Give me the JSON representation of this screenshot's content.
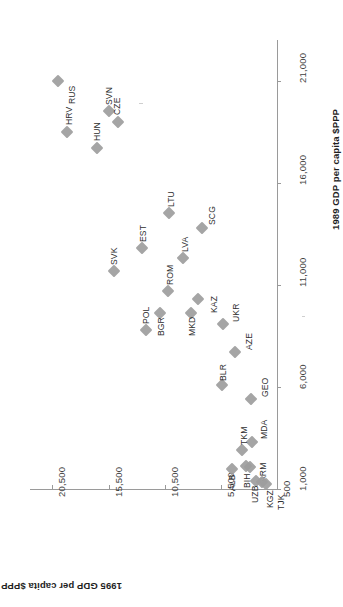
{
  "chart_data": {
    "type": "scatter",
    "title": "",
    "xlabel": "1989 GDP per capita $PPP",
    "ylabel": "1995 GDP per capita $PPP",
    "xlim": [
      1000,
      23000
    ],
    "ylim": [
      500,
      22500
    ],
    "xticks": [
      "1,000",
      "6,000",
      "11,000",
      "16,000",
      "21,000"
    ],
    "xtick_values": [
      1000,
      6000,
      11000,
      16000,
      21000
    ],
    "yticks": [
      "500",
      "5,500",
      "10,500",
      "15,500",
      "20,500"
    ],
    "ytick_values": [
      500,
      5500,
      10500,
      15500,
      20500
    ],
    "grid": false,
    "legend": false,
    "rotation_deg": -90,
    "marker_color": "#9d9d9d",
    "axis_color": "#9a9a9a",
    "points": [
      {
        "label": "RUS",
        "x": 21000,
        "y": 20000,
        "label_dx": 9,
        "label_dy": 13
      },
      {
        "label": "SVN",
        "x": 19500,
        "y": 15500,
        "label_dx": -5,
        "label_dy": -16
      },
      {
        "label": "CZE",
        "x": 19000,
        "y": 14700,
        "label_dx": -6,
        "label_dy": -17
      },
      {
        "label": "HRV",
        "x": 18500,
        "y": 19200,
        "label_dx": -3,
        "label_dy": -17
      },
      {
        "label": "HUN",
        "x": 17700,
        "y": 16500,
        "label_dx": -5,
        "label_dy": -17
      },
      {
        "label": "LTU",
        "x": 14500,
        "y": 10100,
        "label_dx": -3,
        "label_dy": -16
      },
      {
        "label": "SCG",
        "x": 13800,
        "y": 7200,
        "label_dx": 5,
        "label_dy": -13
      },
      {
        "label": "EST",
        "x": 12800,
        "y": 12500,
        "label_dx": -4,
        "label_dy": -16
      },
      {
        "label": "SVK",
        "x": 11700,
        "y": 15000,
        "label_dx": -5,
        "label_dy": -16
      },
      {
        "label": "LVA",
        "x": 12300,
        "y": 8900,
        "label_dx": -3,
        "label_dy": -16
      },
      {
        "label": "ROM",
        "x": 10700,
        "y": 10200,
        "label_dx": -3,
        "label_dy": -16
      },
      {
        "label": "POL",
        "x": 8800,
        "y": 12200,
        "label_dx": -5,
        "label_dy": -16
      },
      {
        "label": "BGR",
        "x": 9600,
        "y": 10900,
        "label_dx": -4,
        "label_dy": 13
      },
      {
        "label": "MKD",
        "x": 9600,
        "y": 8200,
        "label_dx": -4,
        "label_dy": 13
      },
      {
        "label": "KAZ",
        "x": 10300,
        "y": 7500,
        "label_dx": 11,
        "label_dy": 4
      },
      {
        "label": "UKR",
        "x": 9100,
        "y": 5300,
        "label_dx": 8,
        "label_dy": -12
      },
      {
        "label": "AZE",
        "x": 7700,
        "y": 4200,
        "label_dx": 9,
        "label_dy": -12
      },
      {
        "label": "BLR",
        "x": 6100,
        "y": 5400,
        "label_dx": -4,
        "label_dy": -14
      },
      {
        "label": "GEO",
        "x": 5400,
        "y": 2800,
        "label_dx": 9,
        "label_dy": -12
      },
      {
        "label": "MDA",
        "x": 3300,
        "y": 2700,
        "label_dx": 7,
        "label_dy": -13
      },
      {
        "label": "TKM",
        "x": 2900,
        "y": 3600,
        "label_dx": -3,
        "label_dy": -15
      },
      {
        "label": "BIH",
        "x": 2150,
        "y": 3300,
        "label_dx": -4,
        "label_dy": 12
      },
      {
        "label": "ALB",
        "x": 2000,
        "y": 4500,
        "label_dx": -5,
        "label_dy": 12
      },
      {
        "label": "ARM",
        "x": 2100,
        "y": 2900,
        "label_dx": 8,
        "label_dy": 5
      },
      {
        "label": "UZB",
        "x": 1400,
        "y": 2400,
        "label_dx": -6,
        "label_dy": 12
      },
      {
        "label": "KGZ",
        "x": 1350,
        "y": 1800,
        "label_dx": 3,
        "label_dy": 16
      },
      {
        "label": "TJK",
        "x": 1250,
        "y": 1500,
        "label_dx": 10,
        "label_dy": 16
      }
    ]
  }
}
